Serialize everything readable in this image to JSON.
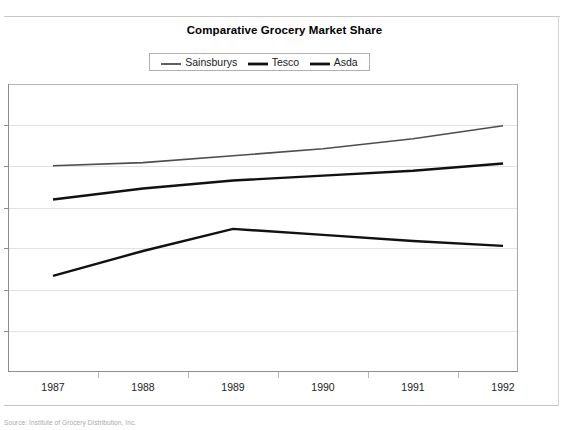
{
  "chart_data": {
    "type": "line",
    "title": "Comparative Grocery Market Share",
    "xlabel": "",
    "ylabel": "",
    "categories": [
      "1987",
      "1988",
      "1989",
      "1990",
      "1991",
      "1992"
    ],
    "series": [
      {
        "name": "Sainsburys",
        "color": "#4d4d4d",
        "width": 1.6,
        "values": [
          71.6,
          72.7,
          75.1,
          77.5,
          81.0,
          85.5
        ]
      },
      {
        "name": "Tesco",
        "color": "#111111",
        "width": 2.4,
        "values": [
          59.9,
          63.7,
          66.5,
          68.2,
          69.9,
          72.4
        ]
      },
      {
        "name": "Asda",
        "color": "#111111",
        "width": 2.4,
        "values": [
          33.4,
          42.0,
          49.7,
          47.6,
          45.5,
          43.8
        ]
      }
    ],
    "ylim": [
      0,
      100
    ],
    "gridlines": [
      0,
      14.3,
      28.6,
      42.9,
      57.1,
      71.4,
      85.7,
      100
    ],
    "grid": true,
    "y_tick_labels_visible": false,
    "legend_position": "top-center"
  },
  "legend": {
    "entries": [
      {
        "label": "Sainsburys"
      },
      {
        "label": "Tesco"
      },
      {
        "label": "Asda"
      }
    ]
  },
  "footer": {
    "caption": "Source: Institute of Grocery Distribution, Inc."
  }
}
